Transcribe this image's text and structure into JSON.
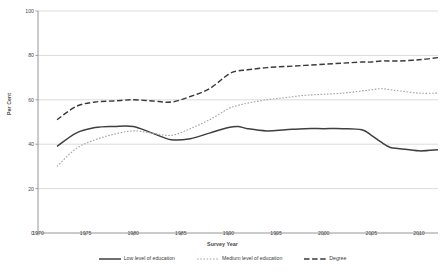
{
  "chart_data": {
    "type": "line",
    "title": "",
    "xlabel": "Survey Year",
    "ylabel": "Per Cent",
    "xlim": [
      1970,
      2012
    ],
    "ylim": [
      0,
      100
    ],
    "grid": true,
    "legend_position": "bottom",
    "yticks": [
      100,
      80,
      60,
      40,
      20,
      0
    ],
    "xticks": [
      1970,
      1975,
      1980,
      1985,
      1990,
      1995,
      2000,
      2005,
      2010
    ],
    "x": [
      1972,
      1974,
      1976,
      1978,
      1980,
      1982,
      1984,
      1986,
      1988,
      1990,
      1991,
      1992,
      1994,
      1996,
      1998,
      2000,
      2002,
      2004,
      2005,
      2006,
      2007,
      2008,
      2010,
      2012
    ],
    "series": [
      {
        "name": "Low level of education",
        "style": "solid",
        "color": "#3f3f3f",
        "values": [
          39,
          45,
          47.5,
          48,
          48,
          45,
          42,
          42.5,
          45,
          47.5,
          48,
          47,
          46,
          46.5,
          47,
          47,
          47,
          46.5,
          44,
          41,
          38.5,
          38,
          37,
          37.5
        ]
      },
      {
        "name": "Medium level of education",
        "style": "dotted",
        "color": "#a6a6a6",
        "values": [
          30,
          38,
          42,
          44.5,
          46,
          45,
          44,
          47,
          51,
          56,
          57.5,
          58.5,
          60,
          61,
          62,
          62.5,
          63,
          64,
          64.5,
          65,
          64.5,
          64,
          63,
          63
        ]
      },
      {
        "name": "Degree",
        "style": "dashed",
        "color": "#3a3a3a",
        "values": [
          51,
          57,
          59,
          59.5,
          60,
          59.5,
          59,
          61.5,
          65,
          71.5,
          73,
          73.5,
          74.5,
          75,
          75.5,
          76,
          76.5,
          77,
          77,
          77.5,
          77.5,
          77.5,
          78,
          79
        ]
      }
    ]
  },
  "legend": {
    "items": [
      {
        "label": "Low level of education",
        "style": "solid"
      },
      {
        "label": "Medium level of education",
        "style": "dotted"
      },
      {
        "label": "Degree",
        "style": "dashed"
      }
    ]
  }
}
